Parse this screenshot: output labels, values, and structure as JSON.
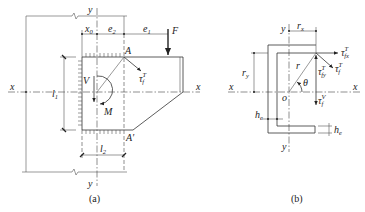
{
  "figure_a": {
    "caption": "(a)",
    "labels": {
      "y_top": "y",
      "y_bottom": "y",
      "x_left": "x",
      "x_right": "x",
      "x0": "x",
      "x0_sub": "0",
      "e2": "e",
      "e2_sub": "2",
      "e1": "e",
      "e1_sub": "1",
      "F": "F",
      "A": "A",
      "A_prime": "A′",
      "tau": "τ",
      "tau_sup": "T",
      "tau_sub": "f",
      "V": "V",
      "M": "M",
      "l1": "l",
      "l1_sub": "1",
      "l2": "l",
      "l2_sub": "2"
    }
  },
  "figure_b": {
    "caption": "(b)",
    "labels": {
      "y_top": "y",
      "y_bottom": "y",
      "x_left": "x",
      "x_right": "x",
      "o": "o",
      "rx": "r",
      "rx_sub": "x",
      "ry": "r",
      "ry_sub": "y",
      "r": "r",
      "theta": "θ",
      "tau_fx": "τ",
      "tau_fx_sup": "T",
      "tau_fx_sub": "fx",
      "tau_fy": "τ",
      "tau_fy_sup": "T",
      "tau_fy_sub": "fy",
      "tau_f": "τ",
      "tau_f_sup": "T",
      "tau_f_sub": "f",
      "tau_v": "τ",
      "tau_v_sup": "V",
      "tau_v_sub": "f",
      "he_left": "h",
      "he_left_sub": "e",
      "he_right": "h",
      "he_right_sub": "e"
    }
  }
}
